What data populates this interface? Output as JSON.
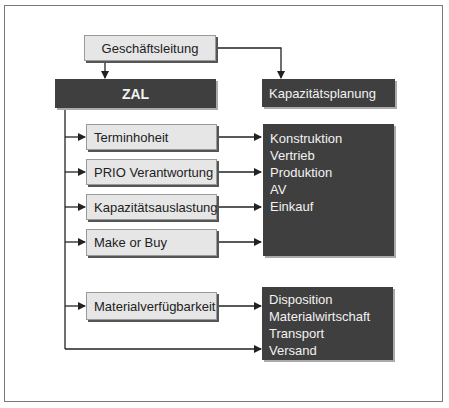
{
  "diagram": {
    "top": {
      "label": "Geschäftsleitung"
    },
    "central": {
      "label": "ZAL"
    },
    "side": {
      "label": "Kapazitätsplanung"
    },
    "functions": [
      {
        "label": "Terminhoheit"
      },
      {
        "label": "PRIO Verantwortung"
      },
      {
        "label": "Kapazitätsauslastung"
      },
      {
        "label": "Make or Buy"
      },
      {
        "label": "Materialverfügbarkeit"
      }
    ],
    "group1": {
      "items": [
        "Konstruktion",
        "Vertrieb",
        "Produktion",
        "AV",
        "Einkauf"
      ]
    },
    "group2": {
      "items": [
        "Disposition",
        "Materialwirtschaft",
        "Transport",
        "Versand"
      ]
    }
  },
  "colors": {
    "dark_box": "#3f3f3f",
    "light_box": "#e6e6e6",
    "line": "#222222"
  }
}
